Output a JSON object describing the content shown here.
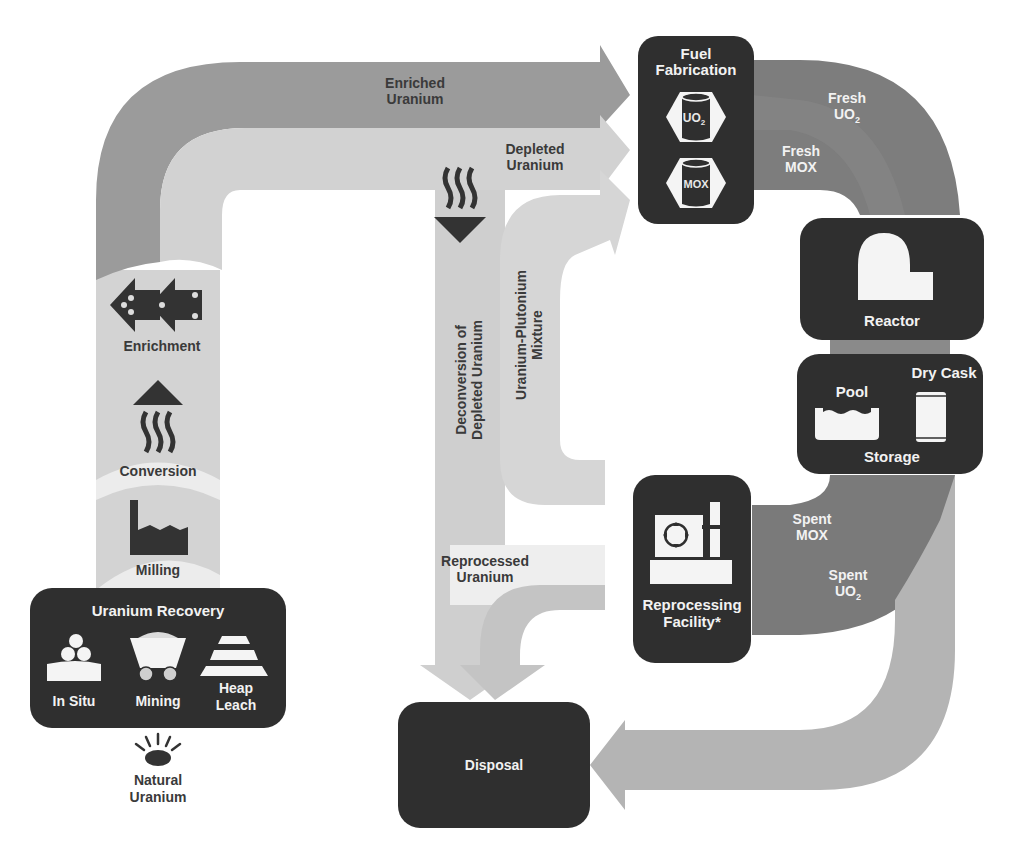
{
  "colors": {
    "background": "#ffffff",
    "node_fill": "#2f2f2f",
    "enriched_flow": "#9a9a9a",
    "depleted_flow": "#d2d2d2",
    "front_flow": "#cfcfcf",
    "milling_flow": "#ececec",
    "fresh_fuel_flow": "#7d7d7d",
    "spent_fuel_flow": "#7a7a7a",
    "to_disposal_flow": "#b4b4b4",
    "recycle_flow": "#c8c8c8",
    "icon_dark": "#333333",
    "icon_light": "#f4f4f4"
  },
  "nodes": {
    "uranium_recovery": {
      "title": "Uranium Recovery",
      "methods": [
        {
          "label": "In Situ",
          "icon": "in-situ-icon"
        },
        {
          "label": "Mining",
          "icon": "mine-cart-icon"
        },
        {
          "label_line1": "Heap",
          "label_line2": "Leach",
          "icon": "heap-leach-icon"
        }
      ]
    },
    "fuel_fabrication": {
      "title_line1": "Fuel",
      "title_line2": "Fabrication",
      "fuels": [
        {
          "label": "UO",
          "subscript": "2",
          "icon": "fuel-canister-icon"
        },
        {
          "label": "MOX",
          "icon": "fuel-canister-icon"
        }
      ]
    },
    "reactor": {
      "title": "Reactor",
      "icon": "reactor-dome-icon"
    },
    "storage": {
      "title": "Storage",
      "options": [
        {
          "label": "Pool",
          "icon": "pool-icon"
        },
        {
          "label": "Dry Cask",
          "icon": "dry-cask-icon"
        }
      ]
    },
    "reprocessing": {
      "title_line1": "Reprocessing",
      "title_line2": "Facility*",
      "icon": "reprocessing-plant-icon"
    },
    "disposal": {
      "title": "Disposal"
    }
  },
  "stages": {
    "milling": {
      "label": "Milling",
      "icon": "factory-icon"
    },
    "conversion": {
      "label": "Conversion",
      "icon": "conversion-arrow-icon"
    },
    "enrichment": {
      "label": "Enrichment",
      "icon": "enrichment-arrows-icon"
    },
    "natural_uranium": {
      "label_line1": "Natural",
      "label_line2": "Uranium",
      "icon": "ore-rock-icon"
    }
  },
  "flows": {
    "enriched_uranium": {
      "line1": "Enriched",
      "line2": "Uranium"
    },
    "depleted_uranium": {
      "line1": "Depleted",
      "line2": "Uranium"
    },
    "deconversion": {
      "line1": "Deconversion of",
      "line2": "Depleted Uranium"
    },
    "u_pu_mixture": {
      "line1": "Uranium-Plutonium",
      "line2": "Mixture"
    },
    "reprocessed_uranium": {
      "line1": "Reprocessed",
      "line2": "Uranium"
    },
    "fresh_uo2": {
      "line1": "Fresh",
      "line2": "UO",
      "sub": "2"
    },
    "fresh_mox": {
      "line1": "Fresh",
      "line2": "MOX"
    },
    "spent_mox": {
      "line1": "Spent",
      "line2": "MOX"
    },
    "spent_uo2": {
      "line1": "Spent",
      "line2": "UO",
      "sub": "2"
    }
  }
}
